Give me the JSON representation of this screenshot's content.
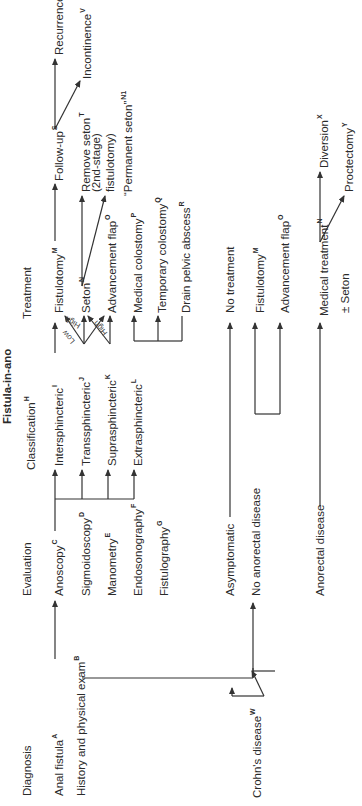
{
  "title": "Fistula-in-ano",
  "headers": {
    "diagnosis": "Diagnosis",
    "evaluation": "Evaluation",
    "classification": "Classification",
    "classification_sup": "H",
    "treatment": "Treatment"
  },
  "diagnosis": {
    "anal_fistula": "Anal fistula",
    "anal_fistula_sup": "A",
    "history_exam": "History and physical exam",
    "history_exam_sup": "B"
  },
  "evaluation": [
    {
      "label": "Anoscopy",
      "sup": "C"
    },
    {
      "label": "Sigmoidoscopy",
      "sup": "D"
    },
    {
      "label": "Manometry",
      "sup": "E"
    },
    {
      "label": "Endosonography",
      "sup": "F"
    },
    {
      "label": "Fistulography",
      "sup": "G"
    }
  ],
  "classification": [
    {
      "label": "Intersphincteric",
      "sup": "I"
    },
    {
      "label": "Transsphincteric",
      "sup": "J"
    },
    {
      "label": "Suprasphincteric",
      "sup": "K"
    },
    {
      "label": "Extrasphincteric",
      "sup": "L"
    }
  ],
  "branch_labels": {
    "low": "Low",
    "high1": "High",
    "high2": "High"
  },
  "treatment": [
    {
      "label": "Fistulotomy",
      "sup": "M"
    },
    {
      "label": "Seton",
      "sup": "N"
    },
    {
      "label": "Advancement flap",
      "sup": "O"
    },
    {
      "label": "Medical colostomy",
      "sup": "P"
    },
    {
      "label": "Temporary colostomy",
      "sup": "Q"
    },
    {
      "label": "Drain pelvic abscess",
      "sup": "R"
    }
  ],
  "followup": {
    "label": "Follow-up",
    "sup": "S",
    "remove_seton": "Remove seton",
    "remove_seton_sup": "T",
    "second_stage": "(2nd-stage)",
    "fistulotomy": "fistulotomy)",
    "permanent_seton": "“Permanent seton”",
    "permanent_seton_sup": "N1"
  },
  "outcomes": [
    {
      "label": "Recurrence",
      "sup": "U"
    },
    {
      "label": "Incontinence",
      "sup": "V"
    }
  ],
  "crohns": {
    "label": "Crohn's  disease",
    "sup": "W",
    "asymptomatic": "Asymptomatic",
    "no_treatment": "No treatment",
    "no_anorectal": "No anorectal disease",
    "fistulotomy": "Fistulotomy",
    "fistulotomy_sup": "M",
    "advancement_flap": "Advancement flap",
    "advancement_flap_sup": "O",
    "anorectal": "Anorectal disease",
    "medical_treatment": "Medical treatment",
    "medical_treatment_sup": "N",
    "seton": "± Seton",
    "diversion": "Diversion",
    "diversion_sup": "X",
    "proctectomy": "Proctectomy",
    "proctectomy_sup": "Y"
  },
  "colors": {
    "line": "#333333",
    "text": "#2a2a2a",
    "background": "#ffffff"
  }
}
